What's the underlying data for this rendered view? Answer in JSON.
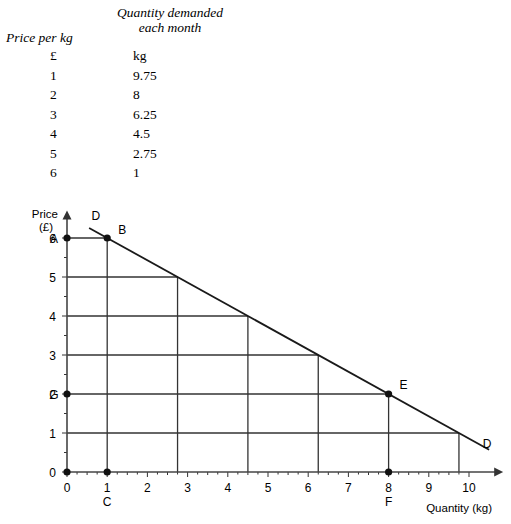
{
  "schedule": {
    "header_price": "Price per kg",
    "header_quantity_line1": "Quantity demanded",
    "header_quantity_line2": "each month",
    "unit_price": "£",
    "unit_quantity": "kg",
    "prices": [
      "1",
      "2",
      "3",
      "4",
      "5",
      "6"
    ],
    "quantities": [
      "9.75",
      "8",
      "6.25",
      "4.5",
      "2.75",
      "1"
    ]
  },
  "chart_data": {
    "type": "line",
    "title": "",
    "xlabel": "Quantity (kg)",
    "ylabel_line1": "Price",
    "ylabel_line2": "(£)",
    "xlim": [
      0,
      10.8
    ],
    "ylim": [
      0,
      6.6
    ],
    "xticks": [
      "0",
      "1",
      "2",
      "3",
      "4",
      "5",
      "6",
      "7",
      "8",
      "9",
      "10"
    ],
    "yticks": [
      "0",
      "1",
      "2",
      "3",
      "4",
      "5",
      "6"
    ],
    "grid": true,
    "series": [
      {
        "name": "D",
        "x": [
          9.75,
          8,
          6.25,
          4.5,
          2.75,
          1
        ],
        "y": [
          1,
          2,
          3,
          4,
          5,
          6
        ]
      }
    ],
    "curve_labels": [
      {
        "text": "D",
        "x": 0.72,
        "y": 6.45
      },
      {
        "text": "D",
        "x": 10.45,
        "y": 0.62
      }
    ],
    "annotations": [
      {
        "text": "A",
        "x": 0,
        "y": 6,
        "marker": true
      },
      {
        "text": "B",
        "x": 1,
        "y": 6,
        "marker": true
      },
      {
        "text": "C",
        "x": 1,
        "y": 0,
        "marker": true
      },
      {
        "text": "E",
        "x": 8,
        "y": 2,
        "marker": true
      },
      {
        "text": "F",
        "x": 8,
        "y": 0,
        "marker": true
      },
      {
        "text": "G",
        "x": 0,
        "y": 2,
        "marker": true
      },
      {
        "text": "",
        "x": 0,
        "y": 0,
        "marker": true
      }
    ]
  }
}
